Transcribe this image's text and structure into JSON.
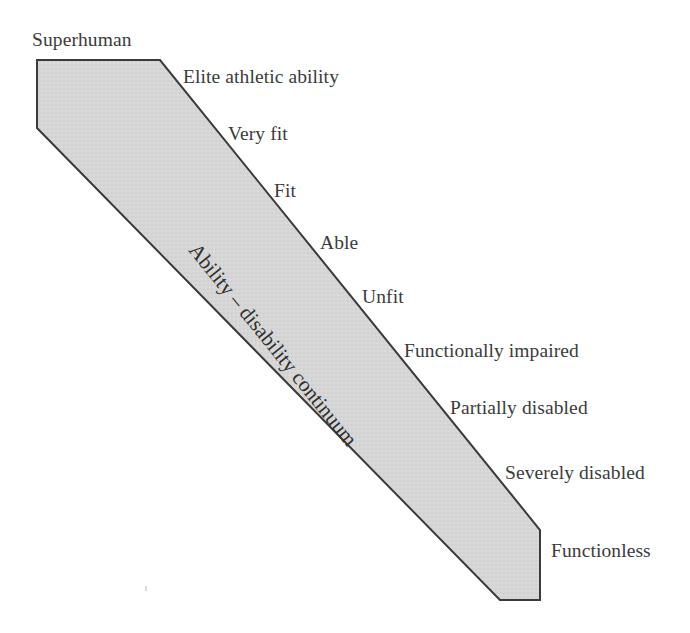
{
  "figure": {
    "type": "diagram",
    "kind": "continuum-wedge",
    "background_color": "#ffffff",
    "band": {
      "fill_color": "#d5d5d5",
      "stroke_color": "#3a3a3a",
      "stroke_width": 2,
      "label": "Ability – disability continuum",
      "label_rotation_deg": 51,
      "label_x": 193,
      "label_y": 236,
      "points": "37,60 160,60 540,530 540,600 500,600 37,128"
    },
    "labels": [
      {
        "text": "Superhuman",
        "x": 32,
        "y": 30,
        "rank": 1
      },
      {
        "text": "Elite athletic ability",
        "x": 183,
        "y": 67,
        "rank": 2
      },
      {
        "text": "Very fit",
        "x": 228,
        "y": 124,
        "rank": 3
      },
      {
        "text": "Fit",
        "x": 274,
        "y": 181,
        "rank": 4
      },
      {
        "text": "Able",
        "x": 320,
        "y": 233,
        "rank": 5
      },
      {
        "text": "Unfit",
        "x": 362,
        "y": 287,
        "rank": 6
      },
      {
        "text": "Functionally impaired",
        "x": 404,
        "y": 341,
        "rank": 7
      },
      {
        "text": "Partially disabled",
        "x": 450,
        "y": 398,
        "rank": 8
      },
      {
        "text": "Severely disabled",
        "x": 505,
        "y": 463,
        "rank": 9
      },
      {
        "text": "Functionless",
        "x": 551,
        "y": 541,
        "rank": 10
      }
    ]
  }
}
